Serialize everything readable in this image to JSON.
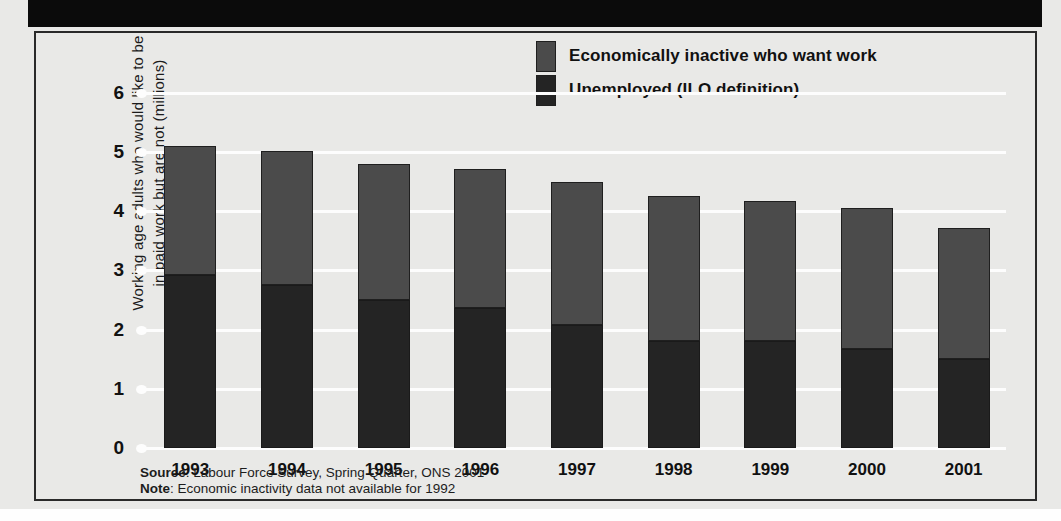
{
  "figure": {
    "title_band_text": "",
    "y_axis_title_line1": "Working age adults who would like to be",
    "y_axis_title_line2": "in paid work but are not (millions)"
  },
  "legend": {
    "items": [
      {
        "label": "Economically inactive who want work",
        "color": "#4b4b4b"
      },
      {
        "label": "Unemployed (ILO definition)",
        "color": "#242424"
      }
    ]
  },
  "notes": {
    "source_label": "Source",
    "source_text": ": Labour Force Survey, Spring Quarter, ONS 2001",
    "note_label": "Note",
    "note_text": ": Economic inactivity data not available for 1992"
  },
  "axis": {
    "y_ticks": [
      "0",
      "1",
      "2",
      "3",
      "4",
      "5",
      "6"
    ],
    "x_ticks": [
      "1993",
      "1994",
      "1995",
      "1996",
      "1997",
      "1998",
      "1999",
      "2000",
      "2001"
    ]
  },
  "chart_data": {
    "type": "bar",
    "stacked": true,
    "title": "",
    "xlabel": "",
    "ylabel": "Working age adults who would like to be in paid work but are not (millions)",
    "ylim": [
      0,
      6
    ],
    "ytick_step": 1,
    "grid": true,
    "legend_position": "top-right",
    "categories": [
      "1993",
      "1994",
      "1995",
      "1996",
      "1997",
      "1998",
      "1999",
      "2000",
      "2001"
    ],
    "series": [
      {
        "name": "Unemployed (ILO definition)",
        "color": "#242424",
        "values": [
          2.93,
          2.75,
          2.5,
          2.37,
          2.08,
          1.81,
          1.81,
          1.68,
          1.51
        ]
      },
      {
        "name": "Economically inactive who want work",
        "color": "#4b4b4b",
        "values": [
          2.17,
          2.26,
          2.3,
          2.35,
          2.42,
          2.45,
          2.37,
          2.37,
          2.21
        ]
      }
    ],
    "totals": [
      5.1,
      5.01,
      4.8,
      4.72,
      4.5,
      4.26,
      4.18,
      4.05,
      3.72
    ]
  }
}
